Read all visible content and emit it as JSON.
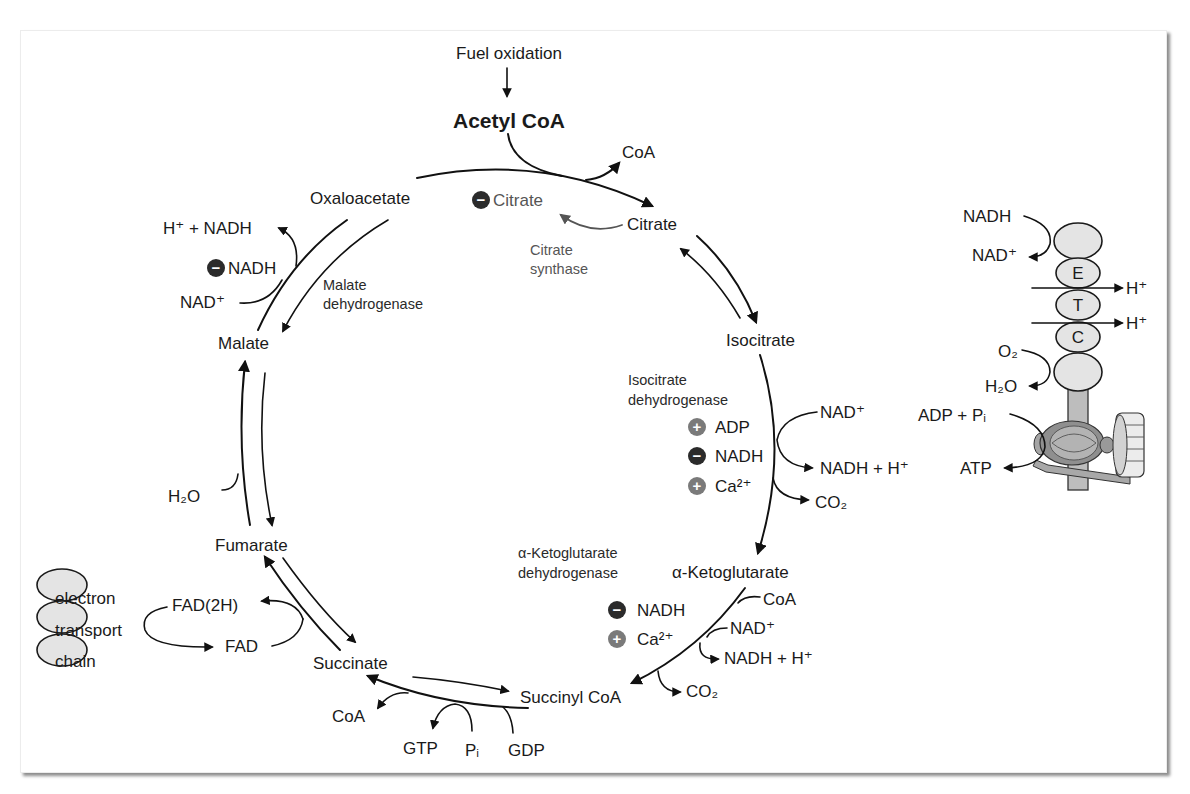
{
  "colors": {
    "line": "#111111",
    "inhibitor_badge": "#2b2b2b",
    "activator_badge": "#7a7a7a",
    "regulator_text_gray": "#555555",
    "complex_fill": "#e4e4e4"
  },
  "entry": {
    "input_label": "Fuel oxidation",
    "substrate": "Acetyl CoA",
    "released": "CoA"
  },
  "intermediates": {
    "oxaloacetate": "Oxaloacetate",
    "citrate": "Citrate",
    "isocitrate": "Isocitrate",
    "alpha_ketoglutarate": "α-Ketoglutarate",
    "succinyl_coa": "Succinyl CoA",
    "succinate": "Succinate",
    "fumarate": "Fumarate",
    "malate": "Malate"
  },
  "citrate_synthase": {
    "name_lines": [
      "Citrate",
      "synthase"
    ],
    "regulators": [
      {
        "sign": "−",
        "effect": "inhibit",
        "label": "Citrate"
      }
    ]
  },
  "malate_dehydrogenase": {
    "name_lines": [
      "Malate",
      "dehydrogenase"
    ],
    "cofactor_in": "NAD⁺",
    "cofactor_out": "H⁺ + NADH",
    "regulators": [
      {
        "sign": "−",
        "effect": "inhibit",
        "label": "NADH"
      }
    ]
  },
  "isocitrate_dehydrogenase": {
    "name_lines": [
      "Isocitrate",
      "dehydrogenase"
    ],
    "cofactor_in": "NAD⁺",
    "cofactor_out": "NADH + H⁺",
    "released": "CO₂",
    "regulators": [
      {
        "sign": "+",
        "effect": "activate",
        "label": "ADP"
      },
      {
        "sign": "−",
        "effect": "inhibit",
        "label": "NADH"
      },
      {
        "sign": "+",
        "effect": "activate",
        "label": "Ca²⁺"
      }
    ]
  },
  "alpha_kg_dehydrogenase": {
    "name_lines": [
      "α-Ketoglutarate",
      "dehydrogenase"
    ],
    "coa_in": "CoA",
    "cofactor_in": "NAD⁺",
    "cofactor_out": "NADH + H⁺",
    "released": "CO₂",
    "regulators": [
      {
        "sign": "−",
        "effect": "inhibit",
        "label": "NADH"
      },
      {
        "sign": "+",
        "effect": "activate",
        "label": "Ca²⁺"
      }
    ]
  },
  "succinyl_coa_step": {
    "released": "CoA",
    "product": "GTP",
    "phosphate": "Pᵢ",
    "nucleotide_in": "GDP"
  },
  "succinate_step": {
    "reduced_carrier": "FAD(2H)",
    "oxidized_carrier": "FAD"
  },
  "fumarate_step": {
    "water": "H₂O"
  },
  "etc_left": {
    "lines": [
      "electron",
      "transport",
      "chain"
    ]
  },
  "etc_right": {
    "nadh": "NADH",
    "nad": "NAD⁺",
    "letters": [
      "E",
      "T",
      "C"
    ],
    "proton_out": [
      "H⁺",
      "H⁺"
    ],
    "oxygen": "O₂",
    "water": "H₂O",
    "atp_inputs": "ADP + Pᵢ",
    "atp": "ATP"
  }
}
